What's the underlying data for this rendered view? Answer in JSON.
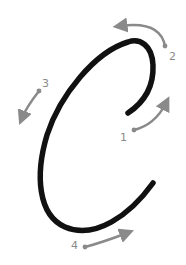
{
  "diagram": {
    "letter": "C",
    "colors": {
      "stroke": "#111111",
      "arrow": "#8a8a8a",
      "background": "#ffffff"
    },
    "steps": [
      {
        "number": "1",
        "direction": "up-right"
      },
      {
        "number": "2",
        "direction": "up-left"
      },
      {
        "number": "3",
        "direction": "down"
      },
      {
        "number": "4",
        "direction": "right"
      }
    ]
  }
}
